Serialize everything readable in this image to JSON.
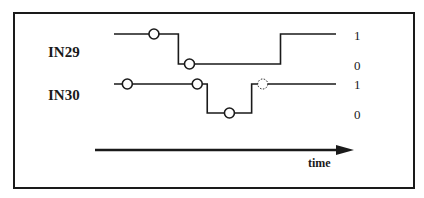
{
  "signals": [
    {
      "name": "IN29",
      "levels": {
        "high": "1",
        "low": "0"
      },
      "waveform": [
        {
          "t": 0.0,
          "level": 1
        },
        {
          "t": 0.29,
          "level": 0
        },
        {
          "t": 0.75,
          "level": 1
        },
        {
          "t": 1.0,
          "level": 1
        }
      ],
      "markers": [
        {
          "t": 0.18,
          "level": 1,
          "style": "solid"
        },
        {
          "t": 0.34,
          "level": 0,
          "style": "solid"
        }
      ]
    },
    {
      "name": "IN30",
      "levels": {
        "high": "1",
        "low": "0"
      },
      "waveform": [
        {
          "t": 0.0,
          "level": 1
        },
        {
          "t": 0.42,
          "level": 0
        },
        {
          "t": 0.62,
          "level": 1
        },
        {
          "t": 1.0,
          "level": 1
        }
      ],
      "markers": [
        {
          "t": 0.06,
          "level": 1,
          "style": "solid"
        },
        {
          "t": 0.375,
          "level": 1,
          "style": "solid"
        },
        {
          "t": 0.52,
          "level": 0,
          "style": "solid"
        },
        {
          "t": 0.67,
          "level": 1,
          "style": "dashed"
        }
      ]
    }
  ],
  "time_axis": {
    "label": "time"
  },
  "colors": {
    "ink": "#1a1a1a",
    "background": "#ffffff"
  }
}
